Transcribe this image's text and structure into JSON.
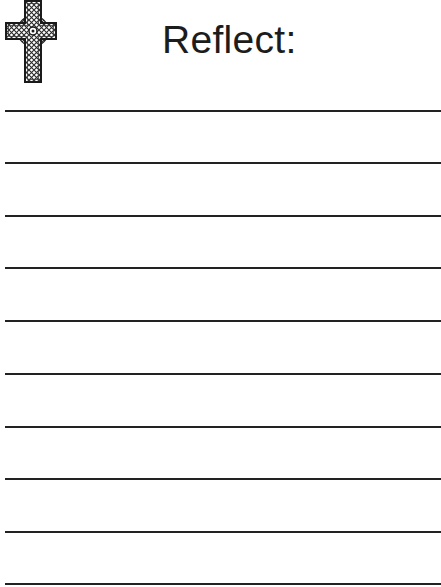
{
  "page": {
    "title": "Reflect:",
    "icon": "celtic-cross-icon",
    "line_color": "#222222",
    "text_color": "#1c1c1c",
    "background": "#ffffff"
  },
  "writing_lines": [
    {
      "y": 111
    },
    {
      "y": 163
    },
    {
      "y": 216
    },
    {
      "y": 268
    },
    {
      "y": 321
    },
    {
      "y": 374
    },
    {
      "y": 427
    },
    {
      "y": 479
    },
    {
      "y": 532
    },
    {
      "y": 584
    }
  ]
}
